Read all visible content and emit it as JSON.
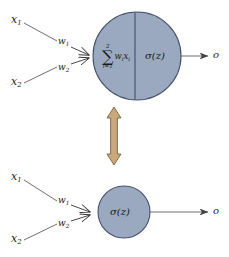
{
  "figure": {
    "colors": {
      "neuron_fill": "#9aa8c0",
      "neuron_stroke": "#44506a",
      "line": "#555555",
      "arrow_fill": "#c9a87c",
      "arrow_stroke": "#6b5535",
      "background": "#ffffff",
      "text": "#1a1a1a"
    },
    "top_panel": {
      "name": "expanded-neuron",
      "inputs": [
        {
          "name": "input-x1",
          "label": "x",
          "sub": "1"
        },
        {
          "name": "input-x2",
          "label": "x",
          "sub": "2"
        }
      ],
      "weights": [
        {
          "name": "weight-w1",
          "label": "w",
          "sub": "1"
        },
        {
          "name": "weight-w2",
          "label": "w",
          "sub": "2"
        }
      ],
      "net_input": {
        "name": "net-input-expression",
        "upper_limit": "2",
        "sigma_glyph": "∑",
        "lower_limit": "i=1",
        "body_w": "w",
        "body_w_sub": "i",
        "body_x": "x",
        "body_x_sub": "i",
        "plain": "sum i=1 to 2 of w_i x_i"
      },
      "activation": {
        "name": "activation-function",
        "text": "σ(z)"
      },
      "output": {
        "name": "output-o",
        "label": "o"
      }
    },
    "middle": {
      "name": "equivalence-double-arrow",
      "direction": "vertical-double-headed"
    },
    "bottom_panel": {
      "name": "compact-neuron",
      "inputs": [
        {
          "name": "input-x1",
          "label": "x",
          "sub": "1"
        },
        {
          "name": "input-x2",
          "label": "x",
          "sub": "2"
        }
      ],
      "weights": [
        {
          "name": "weight-w1",
          "label": "w",
          "sub": "1"
        },
        {
          "name": "weight-w2",
          "label": "w",
          "sub": "2"
        }
      ],
      "activation": {
        "name": "activation-function",
        "text": "σ(z)"
      },
      "output": {
        "name": "output-o",
        "label": "o"
      }
    }
  }
}
